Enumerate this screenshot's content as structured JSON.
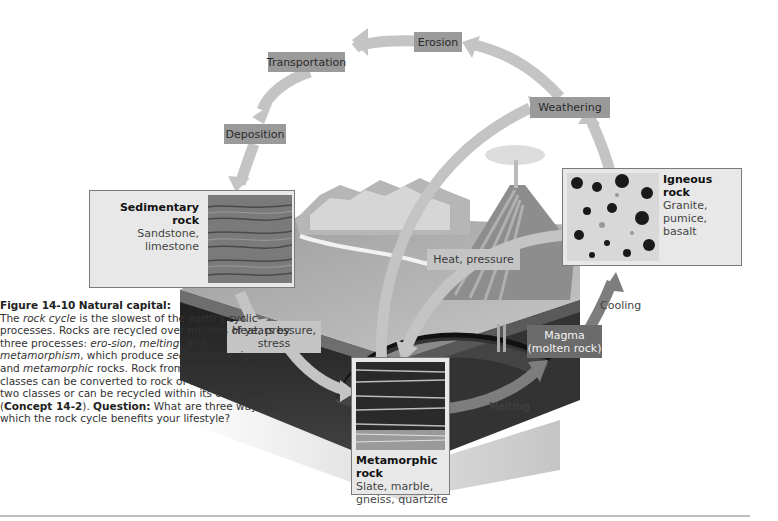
{
  "figure": {
    "number": "Figure 14-10",
    "title": "Natural capital:",
    "caption_parts": {
      "p1": "The ",
      "rock_cycle": "rock cycle",
      "p2": " is the slowest of the earth's cyclic processes. Rocks are recycled over millions of years by three processes: ",
      "erosion": "ero-sion",
      "c1": ", ",
      "melting": "melting",
      "c2": ", and ",
      "metamorphism": "metamorphism",
      "p3": ", which produce ",
      "sedimentary": "sedimentary",
      "c3": ", ",
      "igneous": "igneous",
      "c4": ", and ",
      "metamorphic": "metamorphic",
      "p4": " rocks. Rock from any of these classes can be converted to rock of either of the other two classes or can be recycled within its own class (",
      "concept": "Concept 14-2",
      "p5": "). ",
      "question_label": "Question:",
      "question": " What are three ways in which the rock cycle benefits your lifestyle?"
    }
  },
  "process_labels": {
    "erosion": "Erosion",
    "transportation": "Transportation",
    "deposition": "Deposition",
    "weathering": "Weathering",
    "heat_pressure": "Heat, pressure",
    "heat_pressure_stress_1": "Heat, pressure,",
    "heat_pressure_stress_2": "stress",
    "magma_1": "Magma",
    "magma_2": "(molten rock)",
    "cooling": "Cooling",
    "melting": "Melting"
  },
  "rocks": {
    "sedimentary": {
      "title": "Sedimentary rock",
      "examples": "Sandstone, limestone"
    },
    "igneous": {
      "title": "Igneous rock",
      "examples_1": "Granite, pumice,",
      "examples_2": "basalt"
    },
    "metamorphic": {
      "title": "Metamorphic rock",
      "examples_1": "Slate, marble,",
      "examples_2": "gneiss, quartzite"
    }
  },
  "colors": {
    "arrow": "#c4c4c4",
    "arrow_dark": "#8a8a8a",
    "label_bg": "#9a9a9a",
    "magma_bg": "#6b6b6b",
    "earth_dark": "#2a2a2a"
  }
}
